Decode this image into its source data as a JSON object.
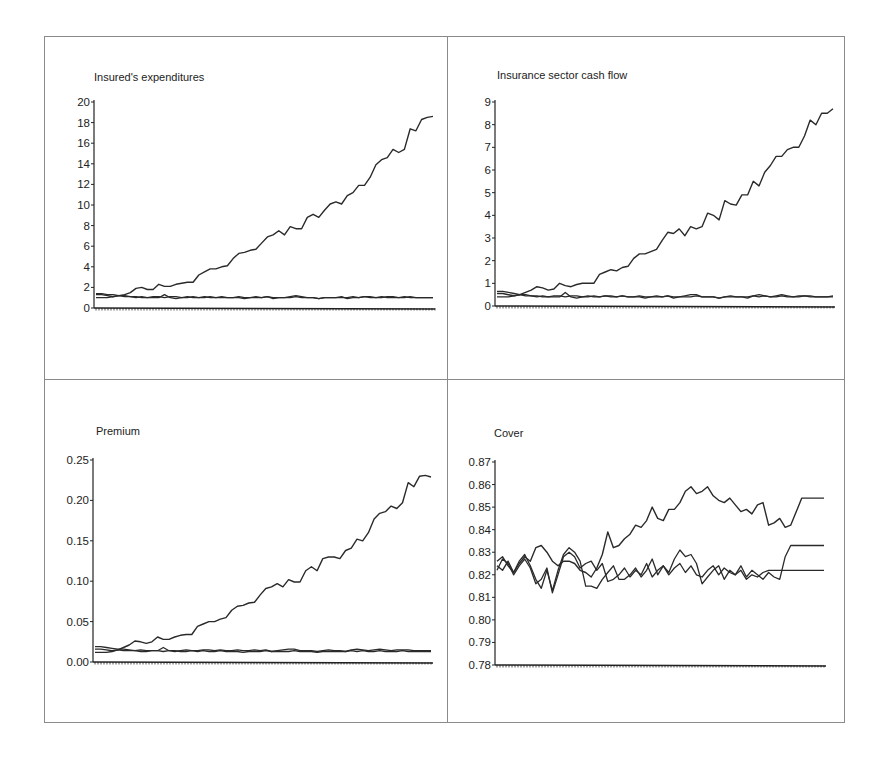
{
  "chart_data": [
    {
      "type": "line",
      "title": "Insured's expenditures",
      "xlabel": "",
      "ylabel": "",
      "ylim": [
        0,
        20
      ],
      "yticks": [
        0,
        2,
        4,
        6,
        8,
        10,
        12,
        14,
        16,
        18,
        20
      ],
      "ytick_labels": [
        "0",
        "2",
        "4",
        "6",
        "8",
        "10",
        "12",
        "14",
        "16",
        "18",
        "20"
      ],
      "grid": false,
      "legend": null,
      "x": [
        0,
        1,
        2,
        3,
        4,
        5,
        6,
        7,
        8,
        9,
        10,
        11,
        12,
        13,
        14,
        15,
        16,
        17,
        18,
        19,
        20,
        21,
        22,
        23,
        24,
        25,
        26,
        27,
        28,
        29,
        30,
        31,
        32,
        33,
        34,
        35,
        36,
        37,
        38,
        39,
        40,
        41,
        42,
        43,
        44,
        45,
        46,
        47,
        48,
        49,
        50,
        51,
        52,
        53,
        54,
        55,
        56,
        57,
        58,
        59
      ],
      "series": [
        {
          "name": "Series 1 (rising)",
          "values": [
            1.3,
            1.3,
            1.2,
            1.1,
            1.2,
            1.3,
            1.5,
            1.9,
            2.0,
            1.8,
            1.8,
            2.3,
            2.1,
            2.1,
            2.3,
            2.4,
            2.5,
            2.5,
            3.2,
            3.5,
            3.8,
            3.8,
            4.0,
            4.1,
            4.8,
            5.3,
            5.4,
            5.6,
            5.7,
            6.3,
            6.9,
            7.1,
            7.5,
            7.1,
            7.9,
            7.7,
            7.7,
            8.8,
            9.1,
            8.8,
            9.5,
            10.1,
            10.3,
            10.1,
            10.9,
            11.2,
            11.9,
            11.9,
            12.7,
            13.9,
            14.4,
            14.6,
            15.4,
            15.1,
            15.4,
            17.4,
            17.2,
            18.3,
            18.5,
            18.6
          ]
        },
        {
          "name": "Series 2",
          "values": [
            1.4,
            1.4,
            1.3,
            1.3,
            1.2,
            1.2,
            1.1,
            1.0,
            1.1,
            1.0,
            1.0,
            1.0,
            1.3,
            1.0,
            0.9,
            1.0,
            1.1,
            1.0,
            1.0,
            1.0,
            1.1,
            1.0,
            1.0,
            1.0,
            1.0,
            1.1,
            1.0,
            1.0,
            1.1,
            1.0,
            1.1,
            0.9,
            1.0,
            1.0,
            1.1,
            1.2,
            1.1,
            1.0,
            1.0,
            0.9,
            1.0,
            1.0,
            1.0,
            1.1,
            0.9,
            1.0,
            1.0,
            1.1,
            1.1,
            1.0,
            1.0,
            1.1,
            1.1,
            1.0,
            1.0,
            1.1,
            1.0,
            1.0,
            1.0,
            1.0
          ]
        },
        {
          "name": "Series 3",
          "values": [
            1.0,
            1.0,
            1.0,
            1.1,
            1.2,
            1.1,
            1.1,
            1.1,
            1.0,
            1.0,
            1.1,
            1.1,
            1.0,
            1.1,
            1.1,
            1.0,
            1.0,
            1.1,
            1.0,
            1.1,
            1.0,
            1.0,
            1.1,
            1.0,
            1.0,
            1.0,
            0.9,
            1.0,
            1.0,
            1.0,
            1.1,
            1.0,
            1.0,
            1.0,
            1.0,
            1.1,
            1.0,
            1.0,
            1.0,
            0.9,
            1.0,
            1.0,
            1.0,
            1.0,
            1.0,
            1.1,
            1.0,
            1.1,
            1.0,
            1.0,
            1.1,
            1.0,
            1.0,
            1.0,
            1.1,
            1.0,
            1.0,
            1.0,
            1.0,
            1.0
          ]
        }
      ]
    },
    {
      "type": "line",
      "title": "Insurance sector cash flow",
      "xlabel": "",
      "ylabel": "",
      "ylim": [
        0,
        9
      ],
      "yticks": [
        0,
        1,
        2,
        3,
        4,
        5,
        6,
        7,
        8,
        9
      ],
      "ytick_labels": [
        "0",
        "1",
        "2",
        "3",
        "4",
        "5",
        "6",
        "7",
        "8",
        "9"
      ],
      "grid": false,
      "legend": null,
      "x": [
        0,
        1,
        2,
        3,
        4,
        5,
        6,
        7,
        8,
        9,
        10,
        11,
        12,
        13,
        14,
        15,
        16,
        17,
        18,
        19,
        20,
        21,
        22,
        23,
        24,
        25,
        26,
        27,
        28,
        29,
        30,
        31,
        32,
        33,
        34,
        35,
        36,
        37,
        38,
        39,
        40,
        41,
        42,
        43,
        44,
        45,
        46,
        47,
        48,
        49,
        50,
        51,
        52,
        53,
        54,
        55,
        56,
        57,
        58,
        59
      ],
      "series": [
        {
          "name": "Series 1 (rising)",
          "values": [
            0.55,
            0.55,
            0.5,
            0.45,
            0.5,
            0.6,
            0.7,
            0.85,
            0.8,
            0.7,
            0.75,
            1.0,
            0.9,
            0.85,
            0.95,
            1.0,
            1.0,
            1.0,
            1.4,
            1.5,
            1.6,
            1.55,
            1.7,
            1.75,
            2.1,
            2.3,
            2.3,
            2.4,
            2.5,
            2.9,
            3.25,
            3.2,
            3.4,
            3.1,
            3.5,
            3.4,
            3.5,
            4.1,
            4.0,
            3.8,
            4.65,
            4.5,
            4.45,
            4.9,
            4.9,
            5.5,
            5.3,
            5.9,
            6.2,
            6.6,
            6.6,
            6.9,
            7.0,
            7.0,
            7.5,
            8.2,
            8.0,
            8.5,
            8.5,
            8.7
          ]
        },
        {
          "name": "Series 2",
          "values": [
            0.65,
            0.65,
            0.6,
            0.55,
            0.5,
            0.5,
            0.45,
            0.4,
            0.45,
            0.4,
            0.4,
            0.4,
            0.6,
            0.4,
            0.35,
            0.4,
            0.45,
            0.4,
            0.4,
            0.45,
            0.45,
            0.4,
            0.45,
            0.4,
            0.4,
            0.45,
            0.4,
            0.4,
            0.45,
            0.4,
            0.45,
            0.35,
            0.4,
            0.45,
            0.5,
            0.5,
            0.4,
            0.4,
            0.4,
            0.35,
            0.4,
            0.45,
            0.4,
            0.4,
            0.35,
            0.45,
            0.5,
            0.45,
            0.4,
            0.45,
            0.5,
            0.45,
            0.4,
            0.45,
            0.45,
            0.45,
            0.4,
            0.4,
            0.4,
            0.45
          ]
        },
        {
          "name": "Series 3",
          "values": [
            0.4,
            0.4,
            0.4,
            0.45,
            0.5,
            0.45,
            0.45,
            0.45,
            0.4,
            0.4,
            0.45,
            0.45,
            0.4,
            0.45,
            0.45,
            0.4,
            0.4,
            0.45,
            0.4,
            0.45,
            0.4,
            0.4,
            0.45,
            0.4,
            0.4,
            0.4,
            0.35,
            0.4,
            0.4,
            0.4,
            0.45,
            0.4,
            0.4,
            0.4,
            0.4,
            0.45,
            0.4,
            0.4,
            0.4,
            0.35,
            0.4,
            0.4,
            0.4,
            0.4,
            0.4,
            0.45,
            0.4,
            0.45,
            0.4,
            0.4,
            0.45,
            0.4,
            0.4,
            0.4,
            0.45,
            0.4,
            0.4,
            0.4,
            0.4,
            0.4
          ]
        }
      ]
    },
    {
      "type": "line",
      "title": "Premium",
      "xlabel": "",
      "ylabel": "",
      "ylim": [
        0.0,
        0.25
      ],
      "yticks": [
        0.0,
        0.05,
        0.1,
        0.15,
        0.2,
        0.25
      ],
      "ytick_labels": [
        "0.00",
        "0.05",
        "0.10",
        "0.15",
        "0.20",
        "0.25"
      ],
      "grid": false,
      "legend": null,
      "x": [
        0,
        1,
        2,
        3,
        4,
        5,
        6,
        7,
        8,
        9,
        10,
        11,
        12,
        13,
        14,
        15,
        16,
        17,
        18,
        19,
        20,
        21,
        22,
        23,
        24,
        25,
        26,
        27,
        28,
        29,
        30,
        31,
        32,
        33,
        34,
        35,
        36,
        37,
        38,
        39,
        40,
        41,
        42,
        43,
        44,
        45,
        46,
        47,
        48,
        49,
        50,
        51,
        52,
        53,
        54,
        55,
        56,
        57,
        58,
        59
      ],
      "series": [
        {
          "name": "Series 1 (rising)",
          "values": [
            0.016,
            0.016,
            0.015,
            0.014,
            0.015,
            0.018,
            0.021,
            0.026,
            0.025,
            0.023,
            0.025,
            0.031,
            0.028,
            0.028,
            0.031,
            0.033,
            0.034,
            0.034,
            0.044,
            0.047,
            0.05,
            0.05,
            0.053,
            0.055,
            0.064,
            0.069,
            0.07,
            0.073,
            0.074,
            0.083,
            0.091,
            0.093,
            0.097,
            0.093,
            0.102,
            0.099,
            0.099,
            0.113,
            0.118,
            0.113,
            0.128,
            0.13,
            0.13,
            0.128,
            0.138,
            0.141,
            0.152,
            0.15,
            0.16,
            0.177,
            0.184,
            0.186,
            0.193,
            0.19,
            0.197,
            0.222,
            0.217,
            0.23,
            0.231,
            0.229
          ]
        },
        {
          "name": "Series 2",
          "values": [
            0.019,
            0.019,
            0.018,
            0.017,
            0.016,
            0.016,
            0.015,
            0.014,
            0.015,
            0.014,
            0.014,
            0.014,
            0.018,
            0.014,
            0.013,
            0.014,
            0.015,
            0.014,
            0.014,
            0.015,
            0.015,
            0.014,
            0.015,
            0.014,
            0.014,
            0.015,
            0.014,
            0.014,
            0.015,
            0.014,
            0.015,
            0.013,
            0.014,
            0.015,
            0.016,
            0.016,
            0.014,
            0.014,
            0.014,
            0.013,
            0.014,
            0.015,
            0.014,
            0.014,
            0.013,
            0.015,
            0.016,
            0.015,
            0.014,
            0.015,
            0.016,
            0.015,
            0.014,
            0.015,
            0.015,
            0.015,
            0.014,
            0.014,
            0.014,
            0.014
          ]
        },
        {
          "name": "Series 3",
          "values": [
            0.012,
            0.012,
            0.012,
            0.013,
            0.015,
            0.014,
            0.014,
            0.014,
            0.013,
            0.013,
            0.014,
            0.014,
            0.013,
            0.014,
            0.014,
            0.013,
            0.013,
            0.014,
            0.013,
            0.014,
            0.013,
            0.013,
            0.014,
            0.013,
            0.013,
            0.013,
            0.012,
            0.013,
            0.013,
            0.013,
            0.014,
            0.013,
            0.013,
            0.013,
            0.013,
            0.014,
            0.013,
            0.013,
            0.013,
            0.012,
            0.013,
            0.013,
            0.013,
            0.013,
            0.013,
            0.014,
            0.013,
            0.014,
            0.013,
            0.013,
            0.014,
            0.013,
            0.013,
            0.013,
            0.014,
            0.013,
            0.013,
            0.013,
            0.013,
            0.013
          ]
        }
      ]
    },
    {
      "type": "line",
      "title": "Cover",
      "xlabel": "",
      "ylabel": "",
      "ylim": [
        0.78,
        0.87
      ],
      "yticks": [
        0.78,
        0.79,
        0.8,
        0.81,
        0.82,
        0.83,
        0.84,
        0.85,
        0.86,
        0.87
      ],
      "ytick_labels": [
        "0.78",
        "0.79",
        "0.80",
        "0.81",
        "0.82",
        "0.83",
        "0.84",
        "0.85",
        "0.86",
        "0.87"
      ],
      "grid": false,
      "legend": null,
      "x": [
        0,
        1,
        2,
        3,
        4,
        5,
        6,
        7,
        8,
        9,
        10,
        11,
        12,
        13,
        14,
        15,
        16,
        17,
        18,
        19,
        20,
        21,
        22,
        23,
        24,
        25,
        26,
        27,
        28,
        29,
        30,
        31,
        32,
        33,
        34,
        35,
        36,
        37,
        38,
        39,
        40,
        41,
        42,
        43,
        44,
        45,
        46,
        47,
        48,
        49,
        50,
        51,
        52,
        53,
        54,
        55,
        56,
        57,
        58,
        59
      ],
      "series": [
        {
          "name": "Series 1 (highest at end)",
          "values": [
            0.824,
            0.822,
            0.826,
            0.821,
            0.825,
            0.828,
            0.826,
            0.832,
            0.833,
            0.83,
            0.826,
            0.824,
            0.826,
            0.826,
            0.825,
            0.822,
            0.821,
            0.819,
            0.823,
            0.829,
            0.839,
            0.832,
            0.833,
            0.836,
            0.838,
            0.842,
            0.841,
            0.844,
            0.85,
            0.845,
            0.844,
            0.849,
            0.849,
            0.852,
            0.857,
            0.859,
            0.856,
            0.857,
            0.859,
            0.855,
            0.853,
            0.852,
            0.854,
            0.851,
            0.848,
            0.849,
            0.847,
            0.851,
            0.852,
            0.842,
            0.843,
            0.845,
            0.841,
            0.842,
            0.848,
            0.854,
            0.854,
            0.854,
            0.854,
            0.854
          ]
        },
        {
          "name": "Series 2",
          "values": [
            0.826,
            0.828,
            0.824,
            0.821,
            0.826,
            0.829,
            0.824,
            0.818,
            0.814,
            0.822,
            0.813,
            0.822,
            0.829,
            0.832,
            0.83,
            0.826,
            0.815,
            0.815,
            0.814,
            0.818,
            0.821,
            0.824,
            0.818,
            0.818,
            0.82,
            0.823,
            0.819,
            0.822,
            0.827,
            0.82,
            0.824,
            0.821,
            0.827,
            0.831,
            0.828,
            0.829,
            0.825,
            0.816,
            0.819,
            0.822,
            0.824,
            0.818,
            0.822,
            0.82,
            0.824,
            0.819,
            0.822,
            0.82,
            0.818,
            0.821,
            0.819,
            0.818,
            0.828,
            0.833,
            0.833,
            0.833,
            0.833,
            0.833,
            0.833,
            0.833
          ]
        },
        {
          "name": "Series 3",
          "values": [
            0.822,
            0.827,
            0.825,
            0.82,
            0.824,
            0.827,
            0.823,
            0.816,
            0.818,
            0.823,
            0.812,
            0.82,
            0.828,
            0.83,
            0.828,
            0.823,
            0.825,
            0.826,
            0.822,
            0.825,
            0.817,
            0.818,
            0.82,
            0.823,
            0.819,
            0.822,
            0.82,
            0.825,
            0.819,
            0.822,
            0.824,
            0.82,
            0.823,
            0.825,
            0.821,
            0.824,
            0.82,
            0.819,
            0.822,
            0.824,
            0.82,
            0.823,
            0.821,
            0.82,
            0.822,
            0.818,
            0.82,
            0.819,
            0.821,
            0.822,
            0.822,
            0.822,
            0.822,
            0.822,
            0.822,
            0.822,
            0.822,
            0.822,
            0.822,
            0.822
          ]
        }
      ]
    }
  ],
  "panels": [
    {
      "title": "Insured's expenditures"
    },
    {
      "title": "Insurance sector cash flow"
    },
    {
      "title": "Premium"
    },
    {
      "title": "Cover"
    }
  ],
  "colors": {
    "line": "#2a2a2a",
    "axis": "#222222",
    "frame": "#8a8a8a",
    "background": "#ffffff"
  }
}
